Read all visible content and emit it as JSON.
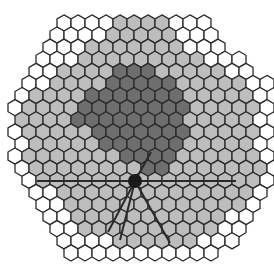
{
  "diagram": {
    "type": "hexagonal-grid",
    "hex": {
      "width": 14,
      "row_step": 12.1,
      "top_row_center_y": 23,
      "stroke": "#2b2b2b",
      "stroke_width": 1.3
    },
    "colors": {
      "W": "#ffffff",
      "L": "#bdbdbd",
      "D": "#6e6e6e"
    },
    "legend_codes": {
      "W": "outer / unassigned cell",
      "L": "light gray cell",
      "D": "dark gray cell"
    },
    "rows": [
      {
        "x0": 64,
        "cells": "WWWWLLLLWWW"
      },
      {
        "x0": 57,
        "cells": "WWWWLLLLLWWW"
      },
      {
        "x0": 50,
        "cells": "WWWLLLLLLLWWW"
      },
      {
        "x0": 43,
        "cells": "WWWLLLLLLLLLWWW"
      },
      {
        "x0": 36,
        "cells": "WWLLLLDDDLLLLLWW"
      },
      {
        "x0": 29,
        "cells": "WWLLLLDDDDDLLLLLWW"
      },
      {
        "x0": 22,
        "cells": "WLLLLDDDDDDDLLLLLW"
      },
      {
        "x0": 15,
        "cells": "WLLLLDDDDDDDDLLLLLW"
      },
      {
        "x0": 22,
        "cells": "LLLLDDDDDDDDLLLLLW"
      },
      {
        "x0": 15,
        "cells": "WLLLLLDDDDDDDLLLLLW"
      },
      {
        "x0": 22,
        "cells": "WLLLLLDDDDDDLLLLLW"
      },
      {
        "x0": 15,
        "cells": "WLLLLLLLDDDDLLLLLLW"
      },
      {
        "x0": 22,
        "cells": "WLLLLLLLLDDLLLLLLLW"
      },
      {
        "x0": 29,
        "cells": "WLLLLLLLLLLLLLLLLW"
      },
      {
        "x0": 36,
        "cells": "WWLLLLLLLLLLLLLLW"
      },
      {
        "x0": 43,
        "cells": "WWLLLLLLLLLLLLLW"
      },
      {
        "x0": 50,
        "cells": "WWLLLLLLLLLLLWW"
      },
      {
        "x0": 57,
        "cells": "WWLLLLLLLLLLWW"
      },
      {
        "x0": 64,
        "cells": "WWWWLLLLLLWWW"
      },
      {
        "x0": 71,
        "cells": "WWWWWWWWWWW"
      }
    ],
    "marker": {
      "name": "center-node",
      "cx": 135,
      "cy": 181,
      "r": 7,
      "fill": "#1a1a1a"
    },
    "lines": [
      {
        "name": "horizontal-axis",
        "x1": 37,
        "y1": 181,
        "x2": 236,
        "y2": 181
      },
      {
        "name": "ray-upper-right",
        "x1": 135,
        "y1": 181,
        "x2": 151,
        "y2": 152
      },
      {
        "name": "ray-lower-left-1",
        "x1": 135,
        "y1": 181,
        "x2": 108,
        "y2": 232
      },
      {
        "name": "ray-lower-left-2",
        "x1": 135,
        "y1": 181,
        "x2": 120,
        "y2": 240
      },
      {
        "name": "ray-lower-right",
        "x1": 135,
        "y1": 181,
        "x2": 170,
        "y2": 243
      }
    ],
    "line_color": "#2a2a2a",
    "line_width": 2
  }
}
